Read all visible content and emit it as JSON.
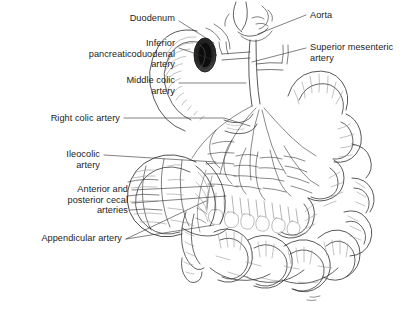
{
  "figure": {
    "type": "anatomical-line-illustration",
    "background_color": "#ffffff",
    "ink_color": "#1c1c1c",
    "line_color": "#3a3a3a",
    "shading_color": "#8a8a8a",
    "canvas": {
      "width": 420,
      "height": 314
    }
  },
  "labels": {
    "duodenum": {
      "text": "Duodenum",
      "align": "right",
      "x": 175,
      "y": 18
    },
    "inferior_pancreaticoduodenal_artery": {
      "line1": "Inferior",
      "line2": "pancreaticoduodenal",
      "line3": "artery",
      "align": "right",
      "x": 175,
      "y": 43
    },
    "middle_colic_artery": {
      "line1": "Middle colic",
      "line2": "artery",
      "align": "right",
      "x": 175,
      "y": 80
    },
    "right_colic_artery": {
      "text": "Right colic artery",
      "align": "right",
      "x": 120,
      "y": 115
    },
    "ileocolic_artery": {
      "line1": "Ileocolic",
      "line2": "artery",
      "align": "right",
      "x": 100,
      "y": 151
    },
    "anterior_posterior_cecal_arteries": {
      "line1": "Anterior and",
      "line2": "posterior cecal",
      "line3": "arteries",
      "align": "right",
      "x": 128,
      "y": 187
    },
    "appendicular_artery": {
      "text": "Appendicular artery",
      "align": "right",
      "x": 122,
      "y": 236
    },
    "aorta": {
      "text": "Aorta",
      "align": "left",
      "x": 310,
      "y": 12
    },
    "superior_mesenteric_artery": {
      "line1": "Superior mesenteric",
      "line2": "artery",
      "align": "left",
      "x": 310,
      "y": 45
    }
  },
  "structures": [
    {
      "name": "duodenum",
      "description": "C-shaped duodenal loop with dark duodenal lumen opening"
    },
    {
      "name": "aorta",
      "description": "abdominal aorta at superior midline"
    },
    {
      "name": "superior-mesenteric-artery",
      "description": "main trunk descending into mesentery"
    },
    {
      "name": "mesentery-arcades",
      "description": "fan of jejunal and ileal arterial arcades"
    },
    {
      "name": "transverse-colon",
      "description": "upper colon loop crossing right"
    },
    {
      "name": "ascending-colon",
      "description": "right colon running inferiorly"
    },
    {
      "name": "cecum",
      "description": "sacculated cecal pouch lower left"
    },
    {
      "name": "appendix",
      "description": "vermiform appendix hanging inferiorly from cecum"
    },
    {
      "name": "small-intestine-coils",
      "description": "coiled jejunum and ileum loops filling right and lower field"
    }
  ]
}
